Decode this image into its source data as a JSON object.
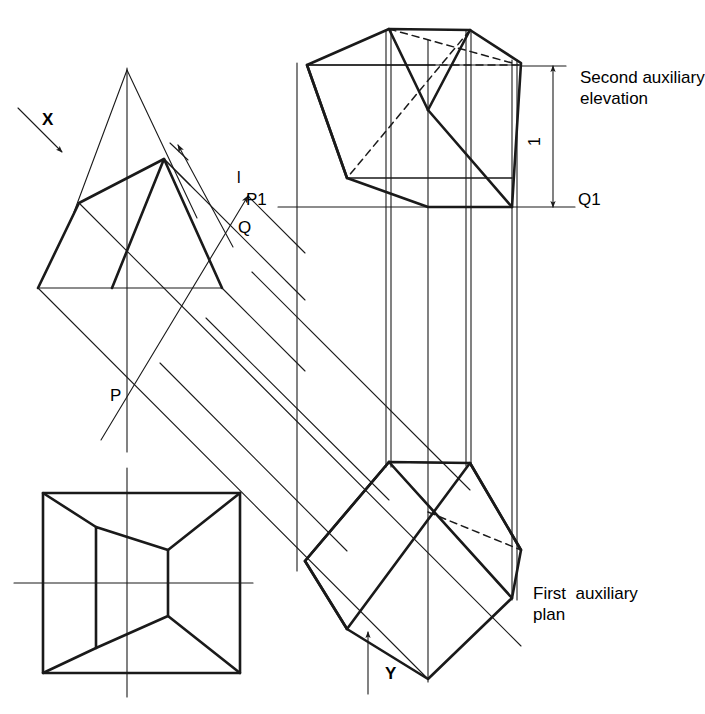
{
  "drawing": {
    "title": "Auxiliary projection of a truncated solid",
    "line_color": "#1a1a1a",
    "background": "#ffffff",
    "projection_angle_deg": 45
  },
  "labels": {
    "direction_x": "X",
    "direction_y": "Y",
    "point_p": "P",
    "point_q": "Q",
    "point_p1": "P1",
    "point_q1": "Q1",
    "dimension_l": "l",
    "dimension_1": "1",
    "note_second_aux_line1": "Second auxiliary",
    "note_second_aux_line2": "elevation",
    "note_first_aux_line1": "First  auxiliary",
    "note_first_aux_line2": "plan"
  },
  "views": {
    "elevation": {
      "name": "Elevation",
      "outline": [
        [
          38,
          288
        ],
        [
          79,
          203
        ],
        [
          164,
          159
        ],
        [
          222,
          288
        ]
      ],
      "apex_lines": [
        [
          [
            127,
            70
          ],
          [
            79,
            203
          ]
        ],
        [
          [
            127,
            70
          ],
          [
            193,
            208
          ]
        ]
      ],
      "centerline": [
        [
          127,
          70
        ],
        [
          127,
          450
        ]
      ]
    },
    "plan": {
      "name": "Plan",
      "outer_square": [
        [
          43,
          493
        ],
        [
          240,
          493
        ],
        [
          240,
          673
        ],
        [
          43,
          673
        ]
      ],
      "inner_quad": [
        [
          96,
          527
        ],
        [
          168,
          550
        ],
        [
          168,
          616
        ],
        [
          96,
          648
        ]
      ],
      "corner_links": [
        [
          [
            43,
            493
          ],
          [
            96,
            527
          ]
        ],
        [
          [
            240,
            493
          ],
          [
            168,
            550
          ]
        ],
        [
          [
            240,
            673
          ],
          [
            168,
            616
          ]
        ],
        [
          [
            43,
            673
          ],
          [
            96,
            648
          ]
        ]
      ],
      "h_centerline": [
        [
          15,
          583
        ],
        [
          252,
          583
        ]
      ],
      "v_centerline": [
        [
          127,
          470
        ],
        [
          127,
          694
        ]
      ]
    },
    "first_auxiliary_plan": {
      "name": "First auxiliary plan",
      "outline": [
        [
          305,
          561
        ],
        [
          389,
          462
        ],
        [
          470,
          463
        ],
        [
          521,
          550
        ],
        [
          512,
          598
        ],
        [
          428,
          679
        ],
        [
          347,
          629
        ]
      ]
    },
    "second_auxiliary_elevation": {
      "name": "Second auxiliary elevation",
      "outline": [
        [
          307,
          65
        ],
        [
          389,
          29
        ],
        [
          470,
          30
        ],
        [
          521,
          63
        ],
        [
          512,
          207
        ],
        [
          428,
          207
        ],
        [
          347,
          178
        ]
      ]
    }
  },
  "reference_lines": {
    "p1_q1": {
      "label_left": "P1",
      "label_right": "Q1",
      "y": 207,
      "x_start": 278,
      "x_end": 575
    },
    "first_aux_pq": {
      "label_near": "P",
      "label_far": "Q",
      "angle_deg": 45
    }
  }
}
